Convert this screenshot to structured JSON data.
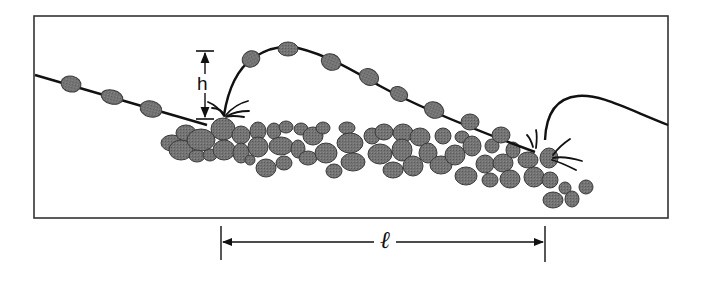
{
  "figure": {
    "labels": {
      "height": "h",
      "length": "ℓ"
    },
    "colors": {
      "grain_fill": "#6e6e6e",
      "grain_stroke": "#333333",
      "line": "#111111",
      "frame": "#333333",
      "background": "#ffffff"
    },
    "frame": {
      "x": 34,
      "y": 16,
      "width": 634,
      "height": 202
    },
    "trajectories": [
      {
        "name": "incoming",
        "grains_on_path": 3
      },
      {
        "name": "main-hop",
        "grains_on_path": 8
      },
      {
        "name": "next-hop",
        "grains_on_path": 0
      }
    ],
    "annotations": {
      "height_marker": {
        "x": 205,
        "y_top": 51,
        "y_bottom": 119
      },
      "length_marker": {
        "x_start": 221,
        "x_end": 545,
        "y": 242
      }
    }
  }
}
